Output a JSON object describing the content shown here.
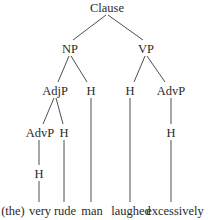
{
  "diagram": {
    "type": "syntax-tree",
    "nodes": {
      "root": {
        "label": "Clause",
        "x": 107,
        "y": 12
      },
      "np": {
        "label": "NP",
        "x": 70,
        "y": 52
      },
      "vp": {
        "label": "VP",
        "x": 146,
        "y": 52
      },
      "adjp": {
        "label": "AdjP",
        "x": 55,
        "y": 94
      },
      "np_h": {
        "label": "H",
        "x": 91,
        "y": 94
      },
      "vp_h": {
        "label": "H",
        "x": 130,
        "y": 94
      },
      "vp_advp": {
        "label": "AdvP",
        "x": 171,
        "y": 94
      },
      "adjp_advp": {
        "label": "AdvP",
        "x": 40,
        "y": 136
      },
      "adjp_h": {
        "label": "H",
        "x": 64,
        "y": 136
      },
      "vp_advp_h": {
        "label": "H",
        "x": 171,
        "y": 136
      },
      "adjp_advp_h": {
        "label": "H",
        "x": 39,
        "y": 177
      }
    },
    "words": [
      {
        "text": "(the)",
        "x": 13,
        "y": 215
      },
      {
        "text": "very",
        "x": 40,
        "y": 215
      },
      {
        "text": "rude",
        "x": 65,
        "y": 215
      },
      {
        "text": "man",
        "x": 92,
        "y": 215
      },
      {
        "text": "laughed",
        "x": 131,
        "y": 215
      },
      {
        "text": "excessively",
        "x": 175,
        "y": 215
      }
    ],
    "edges": [
      {
        "from": "Clause",
        "to": "NP"
      },
      {
        "from": "Clause",
        "to": "VP"
      },
      {
        "from": "NP",
        "to": "AdjP"
      },
      {
        "from": "NP",
        "to": "H"
      },
      {
        "from": "VP",
        "to": "H"
      },
      {
        "from": "VP",
        "to": "AdvP"
      },
      {
        "from": "AdjP",
        "to": "AdvP"
      },
      {
        "from": "AdjP",
        "to": "H"
      },
      {
        "from": "AdvP",
        "to": "H"
      },
      {
        "from": "H",
        "to": "very"
      },
      {
        "from": "H",
        "to": "rude"
      },
      {
        "from": "H",
        "to": "man"
      },
      {
        "from": "H",
        "to": "laughed"
      },
      {
        "from": "H",
        "to": "excessively"
      }
    ]
  }
}
